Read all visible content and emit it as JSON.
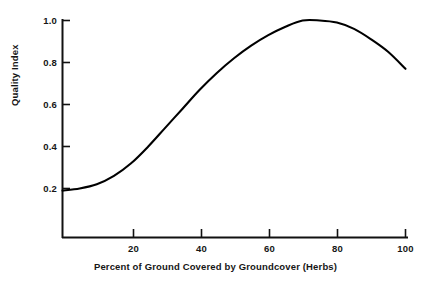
{
  "chart_data": {
    "type": "line",
    "title": "",
    "xlabel": "Percent of Ground Covered by Groundcover (Herbs)",
    "ylabel": "Quality Index",
    "xlim": [
      0,
      100
    ],
    "ylim": [
      0,
      1.05
    ],
    "grid": false,
    "legend": null,
    "xticks": [
      20,
      40,
      60,
      80,
      100
    ],
    "xtick_labels": [
      "20",
      "40",
      "60",
      "80",
      "100"
    ],
    "yticks": [
      0.2,
      0.4,
      0.6,
      0.8,
      1.0
    ],
    "ytick_labels": [
      "0.2",
      "0.4",
      "0.6",
      "0.8",
      "1.0"
    ],
    "line_color": "#000000",
    "line_width": 2,
    "series": [
      {
        "name": "Quality Index",
        "x": [
          0,
          5,
          10,
          15,
          20,
          25,
          30,
          35,
          40,
          45,
          50,
          55,
          60,
          65,
          70,
          75,
          80,
          85,
          90,
          95,
          100
        ],
        "y": [
          0.19,
          0.2,
          0.22,
          0.26,
          0.32,
          0.4,
          0.49,
          0.58,
          0.67,
          0.75,
          0.82,
          0.88,
          0.93,
          0.97,
          1.0,
          1.0,
          0.99,
          0.96,
          0.91,
          0.85,
          0.77
        ]
      }
    ],
    "annotations": []
  },
  "axis": {
    "x_title": "Percent of Ground Covered by Groundcover (Herbs)",
    "y_title": "Quality Index"
  }
}
